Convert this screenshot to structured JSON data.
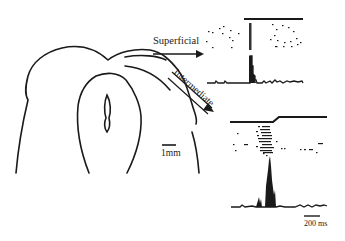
{
  "figure": {
    "labels": {
      "superficial": "Superficial",
      "intermediate": "Intermediate",
      "scale_anatomy": "1mm",
      "scale_time": "200 ms"
    },
    "colors": {
      "ink": "#1a1a1a",
      "background": "#ffffff"
    },
    "panels": [
      {
        "name": "superficial-response",
        "stimulus": "step-on",
        "raster_rows": 10,
        "histogram_peak": "sharp single peak at stimulus onset"
      },
      {
        "name": "intermediate-response",
        "stimulus": "ramp-step",
        "raster_rows": 10,
        "histogram_peak": "broad tall peak shortly after stimulus onset"
      }
    ]
  }
}
